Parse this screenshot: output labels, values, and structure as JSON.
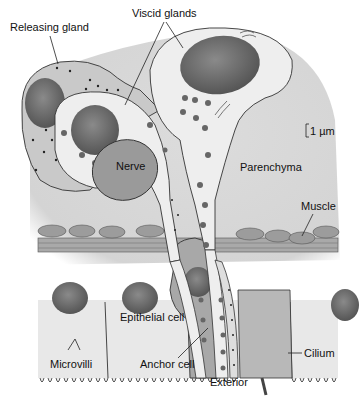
{
  "figure": {
    "type": "biological cross-section diagram"
  },
  "labels": {
    "releasing_gland": "Releasing gland",
    "viscid_glands": "Viscid glands",
    "scale_bar": "1 µm",
    "nerve": "Nerve",
    "parenchyma": "Parenchyma",
    "muscle": "Muscle",
    "epithelial_cell": "Epithelial cell",
    "microvilli": "Microvilli",
    "anchor_cell": "Anchor cell",
    "cilium": "Cilium",
    "exterior": "Exterior"
  },
  "colors": {
    "background": "#ffffff",
    "parenchyma": "#d9d9d9",
    "gland_cytoplasm": "#eeeeee",
    "releasing_gland_fill": "#c9c9c9",
    "nucleus": "#6e6e6e",
    "nerve": "#9a9a9a",
    "epithelium": "#e6e6e6",
    "anchor_cell": "#a8a8a8",
    "muscle": "#9c9c9c",
    "outline": "#333333"
  }
}
